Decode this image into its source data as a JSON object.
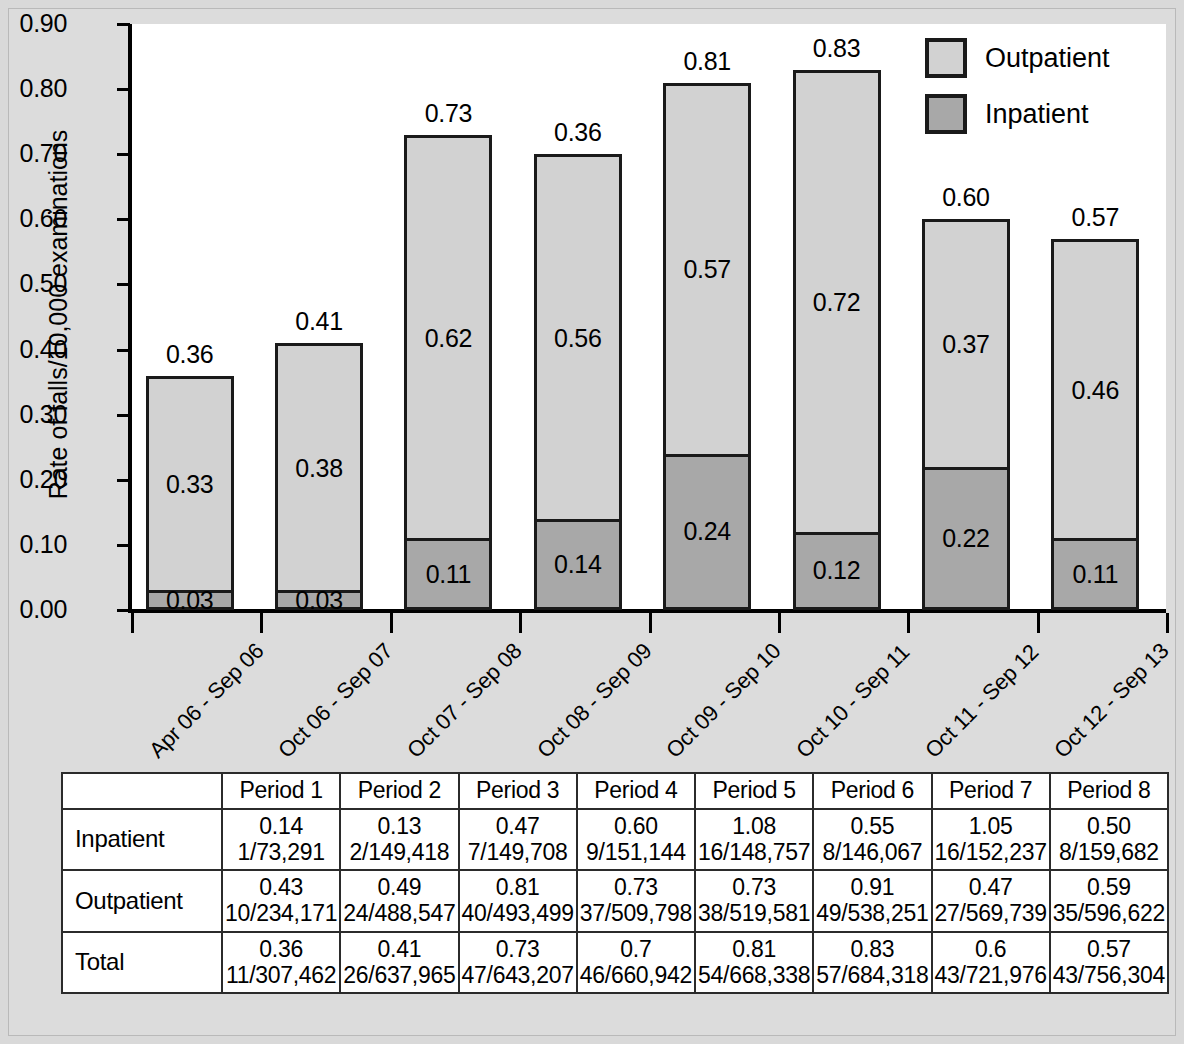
{
  "chart_data": {
    "type": "bar",
    "subtype": "stacked-bar",
    "title": "",
    "xlabel": "",
    "ylabel": "Rate of falls/10,000 examinations",
    "ylim": [
      0.0,
      0.9
    ],
    "ytick_labels": [
      "0.90",
      "0.80",
      "0.70",
      "0.60",
      "0.50",
      "0.40",
      "0.30",
      "0.20",
      "0.10",
      "0.00"
    ],
    "ytick_values": [
      0.9,
      0.8,
      0.7,
      0.6,
      0.5,
      0.4,
      0.3,
      0.2,
      0.1,
      0.0
    ],
    "grid": false,
    "legend_position": "top-right",
    "categories": [
      "Apr 06 - Sep 06",
      "Oct 06 - Sep 07",
      "Oct 07 - Sep 08",
      "Oct 08 - Sep 09",
      "Oct 09 - Sep 10",
      "Oct 10 - Sep 11",
      "Oct 11 - Sep 12",
      "Oct 12 - Sep 13"
    ],
    "series": [
      {
        "name": "Inpatient",
        "color": "#a8a8a8",
        "values": [
          0.03,
          0.03,
          0.11,
          0.14,
          0.24,
          0.12,
          0.22,
          0.11
        ],
        "labels": [
          "0.03",
          "0.03",
          "0.11",
          "0.14",
          "0.24",
          "0.12",
          "0.22",
          "0.11"
        ]
      },
      {
        "name": "Outpatient",
        "color": "#d2d2d2",
        "values": [
          0.33,
          0.38,
          0.62,
          0.56,
          0.57,
          0.72,
          0.37,
          0.46
        ],
        "labels": [
          "0.33",
          "0.38",
          "0.62",
          "0.56",
          "0.57",
          "0.72",
          "0.37",
          "0.46"
        ]
      }
    ],
    "total_labels": [
      "0.36",
      "0.41",
      "0.73",
      "0.36",
      "0.81",
      "0.83",
      "0.60",
      "0.57"
    ],
    "bar_tops": [
      0.36,
      0.41,
      0.73,
      0.7,
      0.81,
      0.83,
      0.6,
      0.57
    ]
  },
  "legend": {
    "items": [
      {
        "label": "Outpatient",
        "swatch": "#d2d2d2"
      },
      {
        "label": "Inpatient",
        "swatch": "#a8a8a8"
      }
    ]
  },
  "table": {
    "corner_label": "",
    "columns": [
      "Period 1",
      "Period 2",
      "Period 3",
      "Period 4",
      "Period 5",
      "Period 6",
      "Period 7",
      "Period 8"
    ],
    "rows": [
      {
        "label": "Inpatient",
        "rates": [
          "0.14",
          "0.13",
          "0.47",
          "0.60",
          "1.08",
          "0.55",
          "1.05",
          "0.50"
        ],
        "fractions": [
          "1/73,291",
          "2/149,418",
          "7/149,708",
          "9/151,144",
          "16/148,757",
          "8/146,067",
          "16/152,237",
          "8/159,682"
        ]
      },
      {
        "label": "Outpatient",
        "rates": [
          "0.43",
          "0.49",
          "0.81",
          "0.73",
          "0.73",
          "0.91",
          "0.47",
          "0.59"
        ],
        "fractions": [
          "10/234,171",
          "24/488,547",
          "40/493,499",
          "37/509,798",
          "38/519,581",
          "49/538,251",
          "27/569,739",
          "35/596,622"
        ]
      },
      {
        "label": "Total",
        "rates": [
          "0.36",
          "0.41",
          "0.73",
          "0.7",
          "0.81",
          "0.83",
          "0.6",
          "0.57"
        ],
        "fractions": [
          "11/307,462",
          "26/637,965",
          "47/643,207",
          "46/660,942",
          "54/668,338",
          "57/684,318",
          "43/721,976",
          "43/756,304"
        ]
      }
    ]
  },
  "colors": {
    "page_background": "#d9d9d9",
    "plot_background": "#ffffff",
    "axis": "#000000",
    "outpatient": "#d2d2d2",
    "inpatient": "#a8a8a8",
    "bar_border": "#1a1a1a",
    "table_border": "#2b2b2b"
  }
}
